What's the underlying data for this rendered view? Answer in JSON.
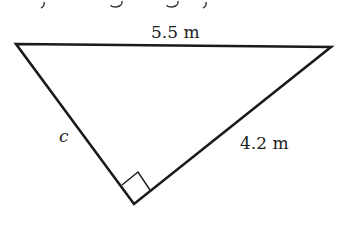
{
  "header": {
    "partial_text": "y g g y"
  },
  "diagram": {
    "type": "right-triangle",
    "hypotenuse_label": "5.5 m",
    "leg_b_label": "4.2 m",
    "leg_a_label": "c",
    "right_angle_at": "bottom vertex",
    "line_color": "#1a1a1a"
  }
}
